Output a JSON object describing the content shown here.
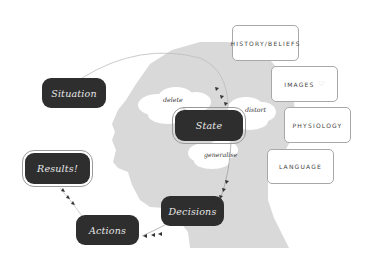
{
  "diagram": {
    "nodes": {
      "situation": "Situation",
      "state": "State",
      "decisions": "Decisions",
      "actions": "Actions",
      "results": "Results!"
    },
    "filters": {
      "delete": "delete",
      "distort": "distort",
      "generalise": "generalise"
    },
    "influences": [
      {
        "label": "HISTORY/BELIEFS"
      },
      {
        "label": "IMAGES"
      },
      {
        "label": "PHYSIOLOGY"
      },
      {
        "label": "LANGUAGE"
      }
    ],
    "colors": {
      "node_fill": "#2e2e2e",
      "node_text": "#e8e8e8",
      "head_fill": "#d9d9d9",
      "cloud_fill": "#ffffff",
      "box_border": "#a8a8a8"
    },
    "flow": [
      "Situation",
      "State",
      "Decisions",
      "Actions",
      "Results!"
    ]
  }
}
